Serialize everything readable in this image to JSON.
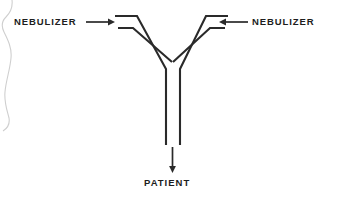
{
  "figure": {
    "type": "diagram",
    "background_color": "#ffffff",
    "line_color": "#2a2a2a",
    "artifact_color": "#cfcfcf"
  },
  "labels": {
    "nebulizer_left": "NEBULIZER",
    "nebulizer_right": "NEBULIZER",
    "patient": "PATIENT"
  },
  "icons": {
    "arrow_left_inflow": "arrow-right-icon",
    "arrow_right_inflow": "arrow-left-icon",
    "arrow_patient_outflow": "arrow-down-icon"
  }
}
